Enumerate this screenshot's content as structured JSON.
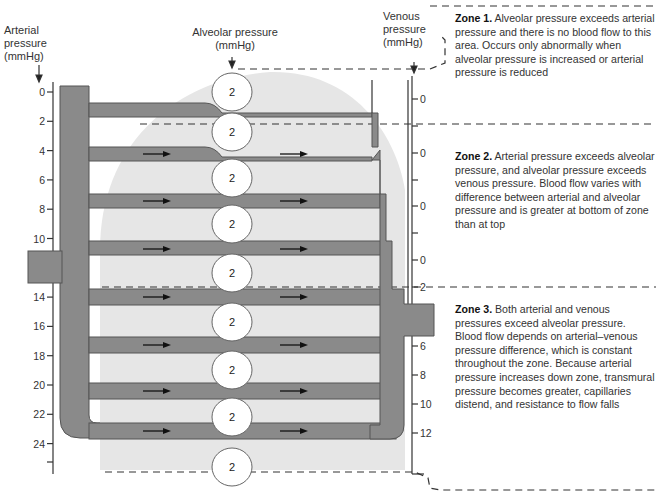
{
  "axes": {
    "arterial": {
      "title_lines": [
        "Arterial",
        "pressure",
        "(mmHg)"
      ],
      "ticks": [
        "0",
        "2",
        "4",
        "6",
        "8",
        "10",
        "",
        "14",
        "16",
        "18",
        "20",
        "22",
        "24"
      ]
    },
    "alveolar": {
      "title_lines": [
        "Alveolar pressure",
        "(mmHg)"
      ],
      "value": "2"
    },
    "venous": {
      "title_lines": [
        "Venous",
        "pressure",
        "(mmHg)"
      ],
      "ticks_upper": [
        "0",
        "0",
        "0",
        "0",
        "2"
      ],
      "ticks_lower": [
        "6",
        "8",
        "10",
        "12"
      ]
    }
  },
  "alveoli": [
    "2",
    "2",
    "2",
    "2",
    "2",
    "2",
    "2",
    "2",
    "2"
  ],
  "zones": [
    {
      "title": "Zone 1.",
      "text": "Alveolar pressure exceeds arterial pressure and there is no blood flow to this area. Occurs only abnormally when alveolar pressure is increased or arterial pressure is reduced"
    },
    {
      "title": "Zone 2.",
      "text": "Arterial pressure exceeds alveolar pressure, and alveolar pressure exceeds venous pressure. Blood flow varies with difference between arterial and alveolar pressure and is greater at bottom of zone than at top"
    },
    {
      "title": "Zone 3.",
      "text": "Both arterial and venous pressures exceed alveolar pressure. Blood flow depends on arterial–venous pressure difference, which is constant throughout the zone. Because arterial pressure increases down zone, transmural pressure becomes greater, capillaries distend, and resistance to flow falls"
    }
  ],
  "colors": {
    "vessel": "#8a8a8a",
    "vessel_edge": "#555555",
    "lung": "#e6e6e6",
    "axis": "#333333",
    "alveolus_fill": "#ffffff"
  }
}
